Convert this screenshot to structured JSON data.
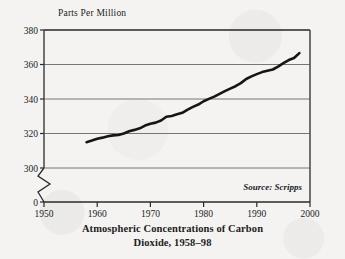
{
  "figure": {
    "background_color": "#f4f3f1",
    "ink_color": "#232323",
    "source_note": "Source: Scripps",
    "title_line1": "Atmospheric Concentrations of Carbon",
    "title_line2": "Dioxide, 1958–98",
    "ylabel": "Parts Per Million"
  },
  "chart_data": {
    "type": "line",
    "subtitle": "",
    "xlabel": "",
    "ylabel": "Parts Per Million",
    "annotations": [
      "Source: Scripps"
    ],
    "legend": [],
    "legend_position": "none",
    "grid": "horizontal",
    "axis_break": {
      "axis": "y",
      "between": [
        0,
        300
      ],
      "style": "zigzag"
    },
    "xlim": [
      1950,
      2000
    ],
    "ylim": [
      300,
      380
    ],
    "xticks": [
      1950,
      1960,
      1970,
      1980,
      1990,
      2000
    ],
    "xtick_labels": [
      "1950",
      "1960",
      "1970",
      "1980",
      "1990",
      "2000"
    ],
    "yticks": [
      0,
      300,
      320,
      340,
      360,
      380
    ],
    "ytick_labels": [
      "0",
      "300",
      "320",
      "340",
      "360",
      "380"
    ],
    "series": [
      {
        "name": "Atmospheric CO2 concentration",
        "color": "#151515",
        "line_width": 2.6,
        "x": [
          1958,
          1959,
          1960,
          1961,
          1962,
          1963,
          1964,
          1965,
          1966,
          1967,
          1968,
          1969,
          1970,
          1971,
          1972,
          1973,
          1974,
          1975,
          1976,
          1977,
          1978,
          1979,
          1980,
          1981,
          1982,
          1983,
          1984,
          1985,
          1986,
          1987,
          1988,
          1989,
          1990,
          1991,
          1992,
          1993,
          1994,
          1995,
          1996,
          1997,
          1998
        ],
        "values": [
          315.0,
          315.9,
          316.9,
          317.6,
          318.4,
          318.9,
          319.1,
          320.0,
          321.3,
          322.1,
          323.0,
          324.6,
          325.7,
          326.3,
          327.5,
          329.7,
          330.2,
          331.1,
          332.0,
          333.8,
          335.4,
          336.8,
          338.7,
          340.1,
          341.4,
          343.0,
          344.6,
          346.0,
          347.4,
          349.2,
          351.6,
          353.1,
          354.4,
          355.6,
          356.4,
          357.1,
          358.8,
          360.8,
          362.6,
          363.8,
          366.6
        ]
      }
    ]
  }
}
